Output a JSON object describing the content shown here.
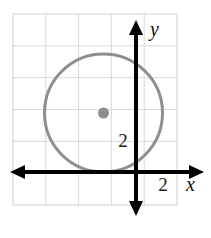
{
  "figure": {
    "kind": "coordinate-plane-circle-graph",
    "width": 211,
    "height": 238,
    "background_color": "#ffffff"
  },
  "grid": {
    "visible": true,
    "line_color": "#d8d8d8",
    "border_color": "#d0d0d0",
    "left": 13,
    "top": 14,
    "right": 177,
    "bottom": 205,
    "columns": 5,
    "rows": 6,
    "cell_size": 32.7
  },
  "axes": {
    "color": "#000000",
    "stroke_width": 4,
    "origin": {
      "x": 136,
      "y": 172
    },
    "x_axis": {
      "label": "x",
      "label_x": 186,
      "label_y": 191,
      "start_x": 12,
      "end_x": 203,
      "y": 172,
      "arrow_left": true,
      "arrow_right": true
    },
    "y_axis": {
      "label": "y",
      "label_x": 150,
      "label_y": 36,
      "x": 136,
      "start_y": 22,
      "end_y": 214,
      "arrow_up": true,
      "arrow_down": true
    }
  },
  "ticks": [
    {
      "name": "y-tick-2",
      "text": "2",
      "x": 123,
      "y": 147,
      "axis": "y",
      "value": 2
    },
    {
      "name": "x-tick-2",
      "text": "2",
      "x": 163,
      "y": 191,
      "axis": "x",
      "value": 2
    }
  ],
  "chart_data": {
    "type": "scatter",
    "title": "",
    "xlabel": "x",
    "ylabel": "y",
    "grid": true,
    "legend": false,
    "xlim": [
      -3.8,
      2.0
    ],
    "ylim": [
      -1.3,
      4.6
    ],
    "unit_px": 32.7,
    "shapes": [
      {
        "name": "circle",
        "type": "circle",
        "center": [
          -1.0,
          1.8
        ],
        "radius": 1.8,
        "center_px": [
          103.5,
          113
        ],
        "radius_px": 59,
        "stroke": "#8e8e8e",
        "stroke_width": 3,
        "fill": "none",
        "tangent_to": "x-axis"
      },
      {
        "name": "center-point",
        "type": "point",
        "coords": [
          -1.0,
          1.8
        ],
        "coords_px": [
          103.5,
          113
        ],
        "fill": "#8e8e8e",
        "radius_px": 5.5
      }
    ],
    "annotations": [
      {
        "text": "2",
        "at_px": [
          123,
          147
        ],
        "meaning": "y-axis value 2"
      },
      {
        "text": "2",
        "at_px": [
          163,
          191
        ],
        "meaning": "x-axis value 2"
      },
      {
        "text": "y",
        "at_px": [
          150,
          36
        ],
        "meaning": "y-axis name"
      },
      {
        "text": "x",
        "at_px": [
          186,
          191
        ],
        "meaning": "x-axis name"
      }
    ]
  }
}
